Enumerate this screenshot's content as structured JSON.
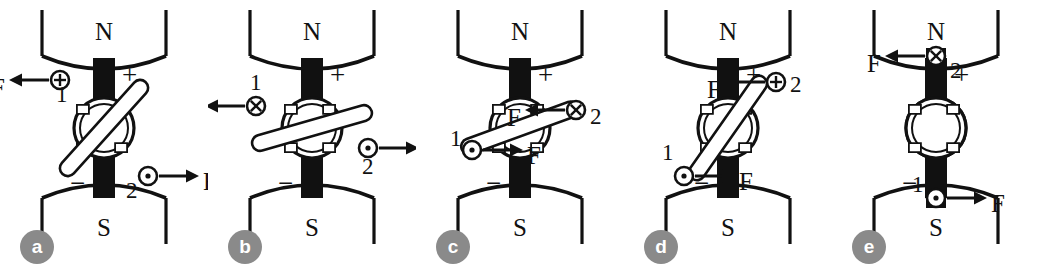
{
  "figure": {
    "type": "diagram",
    "panel_count": 5,
    "background_color": "#ffffff",
    "ink_color": "#111111",
    "badge_color": "#8a8a8a",
    "badge_text_color": "#ffffff"
  },
  "common": {
    "north_pole_label": "N",
    "south_pole_label": "S",
    "plus_sign": "+",
    "minus_sign": "−",
    "force_label": "F",
    "terminal_1_label": "1",
    "terminal_2_label": "2",
    "current_out_symbol": "dot-in-circle",
    "current_in_symbol": "cross-in-circle",
    "current_plus_symbol": "plus-in-circle"
  },
  "panels": [
    {
      "id": "a",
      "badge_label": "a",
      "coil_angle_deg": 48,
      "north_pole_label": "N",
      "south_pole_label": "S",
      "top_sign": "+",
      "bottom_sign": "−",
      "end1": {
        "label": "1",
        "symbol": "plus-in-circle",
        "force_label": "F",
        "force_direction": "left",
        "position": "upper-left"
      },
      "end2": {
        "label": "2",
        "symbol": "dot-in-circle",
        "force_label": "F",
        "force_direction": "right",
        "position": "lower-right"
      }
    },
    {
      "id": "b",
      "badge_label": "b",
      "coil_angle_deg": 16,
      "north_pole_label": "N",
      "south_pole_label": "S",
      "top_sign": "+",
      "bottom_sign": "−",
      "end1": {
        "label": "1",
        "symbol": "cross-in-circle",
        "force_label": "F",
        "force_direction": "left",
        "position": "left"
      },
      "end2": {
        "label": "2",
        "symbol": "dot-in-circle",
        "force_label": "F",
        "force_direction": "right",
        "position": "right"
      }
    },
    {
      "id": "c",
      "badge_label": "c",
      "coil_angle_deg": 20,
      "north_pole_label": "N",
      "south_pole_label": "S",
      "top_sign": "+",
      "bottom_sign": "−",
      "end1": {
        "label": "1",
        "symbol": "dot-in-circle",
        "force_label": "F",
        "force_direction": "right",
        "position": "lower-left"
      },
      "end2": {
        "label": "2",
        "symbol": "cross-in-circle",
        "force_label": "F",
        "force_direction": "left",
        "position": "upper-right"
      }
    },
    {
      "id": "d",
      "badge_label": "d",
      "coil_angle_deg": 55,
      "north_pole_label": "N",
      "south_pole_label": "S",
      "top_sign": "+",
      "bottom_sign": "−",
      "end1": {
        "label": "1",
        "symbol": "dot-in-circle",
        "force_label": "F",
        "force_direction": "right",
        "position": "lower-left"
      },
      "end2": {
        "label": "2",
        "symbol": "plus-in-circle",
        "force_label": "F",
        "force_direction": "left",
        "position": "upper-right"
      }
    },
    {
      "id": "e",
      "badge_label": "e",
      "coil_angle_deg": 90,
      "north_pole_label": "N",
      "south_pole_label": "S",
      "top_sign": "+",
      "bottom_sign": "−",
      "end1": {
        "label": "1",
        "symbol": "dot-in-circle",
        "force_label": "F",
        "force_direction": "right",
        "position": "bottom"
      },
      "end2": {
        "label": "2",
        "symbol": "cross-in-circle",
        "force_label": "F",
        "force_direction": "left",
        "position": "top"
      }
    }
  ]
}
